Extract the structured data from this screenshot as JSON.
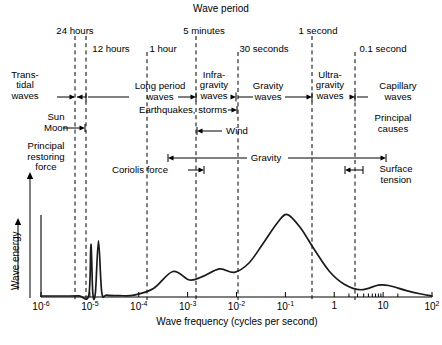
{
  "figure": {
    "top_title": "Wave period",
    "xlabel": "Wave frequency (cycles per second)",
    "ylabel": "Wave energy"
  },
  "period_labels": [
    {
      "text": "24 hours",
      "x": 75
    },
    {
      "text": "12 hours",
      "x": 111
    },
    {
      "text": "1 hour",
      "x": 163
    },
    {
      "text": "5 minutes",
      "x": 204
    },
    {
      "text": "30 seconds",
      "x": 264
    },
    {
      "text": "1 second",
      "x": 318
    },
    {
      "text": "0.1 second",
      "x": 383
    }
  ],
  "bands": [
    {
      "name": "Trans-tidal waves",
      "lines": [
        "Trans-",
        "tidal",
        "waves"
      ],
      "x": 25
    },
    {
      "name": "Long period waves",
      "lines": [
        "Long period",
        "waves"
      ],
      "x": 160
    },
    {
      "name": "Infragravity waves",
      "lines": [
        "Infra-",
        "gravity",
        "waves"
      ],
      "x": 214
    },
    {
      "name": "Gravity waves",
      "lines": [
        "Gravity",
        "waves"
      ],
      "x": 268
    },
    {
      "name": "Ultragravity waves",
      "lines": [
        "Ultra-",
        "gravity",
        "waves"
      ],
      "x": 330
    },
    {
      "name": "Capillary waves",
      "lines": [
        "Capillary",
        "waves"
      ],
      "x": 398
    }
  ],
  "causes": {
    "heading_lines": [
      "Principal",
      "causes"
    ],
    "heading_x": 393,
    "items": [
      {
        "label": "Earthquakes, storms",
        "x": 183
      },
      {
        "label": "Sun",
        "x": 85
      },
      {
        "label": "Moon",
        "x": 85
      },
      {
        "label": "Wind",
        "x": 237
      }
    ]
  },
  "restoring": {
    "heading_lines": [
      "Principal",
      "restoring",
      "force"
    ],
    "heading_x": 46,
    "items": [
      {
        "label": "Coriolis force",
        "x": 140
      },
      {
        "label": "Gravity",
        "x": 266
      },
      {
        "label": "Surface tension",
        "lines": [
          "Surface",
          "tension"
        ],
        "x": 396
      }
    ]
  },
  "dividers": [
    {
      "period": "24 hours",
      "x": 75
    },
    {
      "period": "12 hours",
      "x": 86
    },
    {
      "period": "1 hour",
      "x": 147
    },
    {
      "period": "5 minutes",
      "x": 196
    },
    {
      "period": "30 seconds",
      "x": 238
    },
    {
      "period": "1 second",
      "x": 312
    },
    {
      "period": "0.1 second",
      "x": 355
    }
  ],
  "chart_data": {
    "type": "line",
    "title": "Wave period",
    "xlabel": "Wave frequency (cycles per second)",
    "ylabel": "Wave energy",
    "xscale": "log",
    "xlim": [
      1e-06,
      100
    ],
    "ylim": [
      0,
      1
    ],
    "grid": false,
    "legend": null,
    "xtick_labels": [
      "10",
      "10",
      "10",
      "10",
      "10",
      "10",
      "1",
      "10",
      "10"
    ],
    "xtick_exponents": [
      "-6",
      "-5",
      "-4",
      "-3",
      "-2",
      "-1",
      "",
      "",
      "2"
    ],
    "xticks": [
      1e-06,
      1e-05,
      0.0001,
      0.001,
      0.01,
      0.1,
      1,
      10,
      100
    ],
    "minor_ticks": [
      2,
      3,
      4,
      5,
      6,
      7,
      8,
      9,
      20
    ],
    "annotations": [
      "Trans-tidal waves",
      "Long period waves",
      "Infragravity waves",
      "Gravity waves",
      "Ultragravity waves",
      "Capillary waves",
      "Sun",
      "Moon",
      "Earthquakes, storms",
      "Wind",
      "Coriolis force",
      "Gravity",
      "Surface tension",
      "Principal causes",
      "Principal restoring force"
    ],
    "series": [
      {
        "name": "Wave energy spectrum",
        "points": [
          [
            1e-06,
            0.012
          ],
          [
            3e-06,
            0.012
          ],
          [
            6e-06,
            0.013
          ],
          [
            9.5e-06,
            0.02
          ],
          [
            1.05e-05,
            0.62
          ],
          [
            1.15e-05,
            0.04
          ],
          [
            1.3e-05,
            0.055
          ],
          [
            1.5e-05,
            0.66
          ],
          [
            1.75e-05,
            0.055
          ],
          [
            2.2e-05,
            0.022
          ],
          [
            4e-05,
            0.016
          ],
          [
            8e-05,
            0.022
          ],
          [
            0.0002,
            0.1
          ],
          [
            0.0005,
            0.3
          ],
          [
            0.0011,
            0.2
          ],
          [
            0.002,
            0.24
          ],
          [
            0.0045,
            0.33
          ],
          [
            0.009,
            0.29
          ],
          [
            0.018,
            0.4
          ],
          [
            0.035,
            0.63
          ],
          [
            0.07,
            0.88
          ],
          [
            0.11,
            0.97
          ],
          [
            0.2,
            0.82
          ],
          [
            0.4,
            0.55
          ],
          [
            0.8,
            0.3
          ],
          [
            1.6,
            0.15
          ],
          [
            3.5,
            0.085
          ],
          [
            8,
            0.14
          ],
          [
            13,
            0.135
          ],
          [
            30,
            0.075
          ],
          [
            60,
            0.035
          ],
          [
            100,
            0.012
          ]
        ]
      }
    ]
  }
}
